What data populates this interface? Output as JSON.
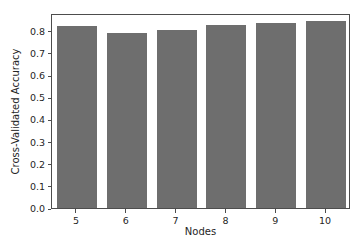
{
  "chart_data": {
    "type": "bar",
    "title": "",
    "xlabel": "Nodes",
    "ylabel": "Cross-Validated Accuracy",
    "categories": [
      "5",
      "6",
      "7",
      "8",
      "9",
      "10"
    ],
    "values": [
      0.823,
      0.791,
      0.802,
      0.827,
      0.834,
      0.845
    ],
    "ylim": [
      0.0,
      0.88
    ],
    "ytick_labels": [
      "0.0",
      "0.1",
      "0.2",
      "0.3",
      "0.4",
      "0.5",
      "0.6",
      "0.7",
      "0.8"
    ],
    "ytick_values": [
      0.0,
      0.1,
      0.2,
      0.3,
      0.4,
      0.5,
      0.6,
      0.7,
      0.8
    ],
    "xtick_labels": [
      "5",
      "6",
      "7",
      "8",
      "9",
      "10"
    ],
    "grid": false,
    "legend": null,
    "bar_color": "#6e6e6e",
    "axis_color": "#4d4d4d",
    "text_color": "#262626",
    "background_color": "#ffffff"
  }
}
